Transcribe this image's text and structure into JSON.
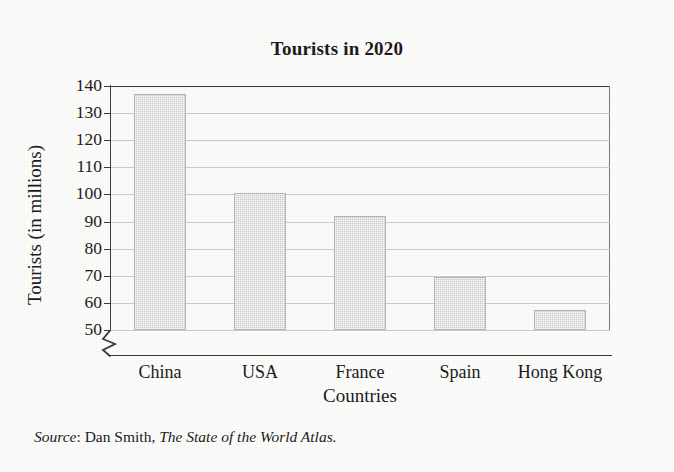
{
  "chart_data": {
    "type": "bar",
    "title": "Tourists in 2020",
    "xlabel": "Countries",
    "ylabel": "Tourists (in millions)",
    "categories": [
      "China",
      "USA",
      "France",
      "Spain",
      "Hong Kong"
    ],
    "values": [
      137,
      100.5,
      92,
      69.5,
      57.5
    ],
    "ylim": [
      50,
      140
    ],
    "yticks": [
      50,
      60,
      70,
      80,
      90,
      100,
      110,
      120,
      130,
      140
    ],
    "ytick_labels": [
      "50",
      "60",
      "70",
      "80",
      "90",
      "100",
      "110",
      "120",
      "130",
      "140"
    ],
    "axis_break": true,
    "axis_break_note": "y-axis broken below 50",
    "grid": true,
    "grid_axis": "y",
    "legend": "none",
    "bar_fill_color": "#cccccc",
    "bar_border_color": "#b4b4b4",
    "gridline_color": "#c9c9c9",
    "axis_color": "#3a3a3a",
    "background_color": "#fbfbfa"
  },
  "source": {
    "label": "Source",
    "separator": ": ",
    "author": "Dan Smith, ",
    "work": "The State of the World Atlas."
  }
}
